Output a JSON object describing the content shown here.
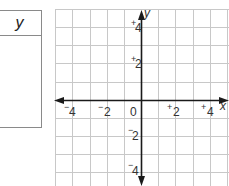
{
  "table": {
    "header": "y",
    "rows": []
  },
  "graph": {
    "x_axis_label": "x",
    "y_axis_label": "y",
    "origin_label": "0",
    "x_ticks": [
      {
        "sign": "−",
        "value": "4"
      },
      {
        "sign": "−",
        "value": "2"
      },
      {
        "sign": "+",
        "value": "2"
      },
      {
        "sign": "+",
        "value": "4"
      }
    ],
    "y_ticks": [
      {
        "sign": "+",
        "value": "4"
      },
      {
        "sign": "+",
        "value": "2"
      },
      {
        "sign": "−",
        "value": "2"
      },
      {
        "sign": "−",
        "value": "4"
      }
    ],
    "grid_range": {
      "x": [
        -5,
        5
      ],
      "y": [
        -5,
        5
      ]
    },
    "colors": {
      "grid": "#c8c8c8",
      "axis": "#1a1a1a",
      "table_border": "#8a8a8a"
    }
  }
}
